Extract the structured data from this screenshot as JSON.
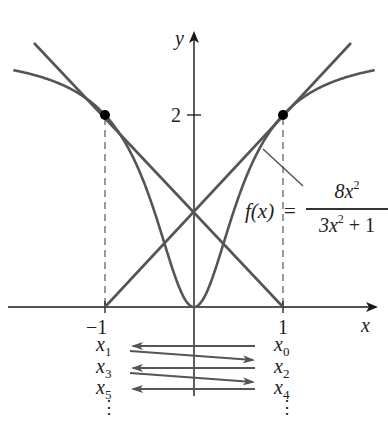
{
  "figure": {
    "type": "diagram",
    "function": {
      "label_lhs": "f(x)",
      "equals": "=",
      "numerator": "8x",
      "numerator_exp": "2",
      "denominator_pre": "3x",
      "denominator_exp": "2",
      "denominator_post": " + 1"
    },
    "axes": {
      "x_label": "x",
      "y_label": "y",
      "x_ticks": [
        "−1",
        "1"
      ],
      "y_ticks": [
        "2"
      ]
    },
    "points": [
      {
        "x": -1,
        "y": 2
      },
      {
        "x": 1,
        "y": 2
      }
    ],
    "tangent_lines": [
      {
        "through": [
          -1,
          2
        ],
        "y_intercept": 1,
        "x_intercept": 1
      },
      {
        "through": [
          1,
          2
        ],
        "y_intercept": 1,
        "x_intercept": -1
      }
    ],
    "iterates_left": [
      {
        "base": "x",
        "sub": "1"
      },
      {
        "base": "x",
        "sub": "3"
      },
      {
        "base": "x",
        "sub": "5"
      }
    ],
    "iterates_right": [
      {
        "base": "x",
        "sub": "0"
      },
      {
        "base": "x",
        "sub": "2"
      },
      {
        "base": "x",
        "sub": "4"
      }
    ],
    "ellipsis": "⋮",
    "colors": {
      "curve": "#555555",
      "axis": "#222222",
      "points": "#000000",
      "dashed": "#666666"
    }
  }
}
